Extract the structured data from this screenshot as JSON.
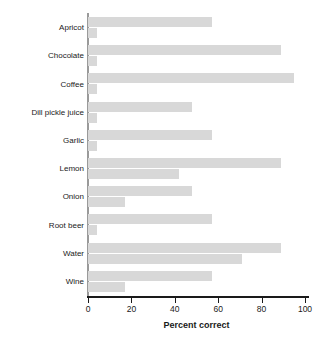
{
  "chart_data": {
    "type": "bar",
    "orientation": "horizontal",
    "title": "",
    "xlabel": "Percent correct",
    "ylabel": "",
    "xlim": [
      0,
      104
    ],
    "xticks": [
      0,
      20,
      40,
      60,
      80,
      100
    ],
    "grid": false,
    "legend": "none",
    "bar_color": "#d8d8d8",
    "categories": [
      "Apricot",
      "Chocolate",
      "Coffee",
      "Dill pickle juice",
      "Garlic",
      "Lemon",
      "Onion",
      "Root beer",
      "Water",
      "Wine"
    ],
    "series": [
      {
        "name": "Primary",
        "values": [
          57,
          89,
          95,
          48,
          57,
          89,
          48,
          57,
          89,
          57
        ]
      },
      {
        "name": "Secondary",
        "values": [
          4,
          4,
          4,
          4,
          4,
          42,
          17,
          4,
          71,
          17
        ]
      }
    ]
  }
}
